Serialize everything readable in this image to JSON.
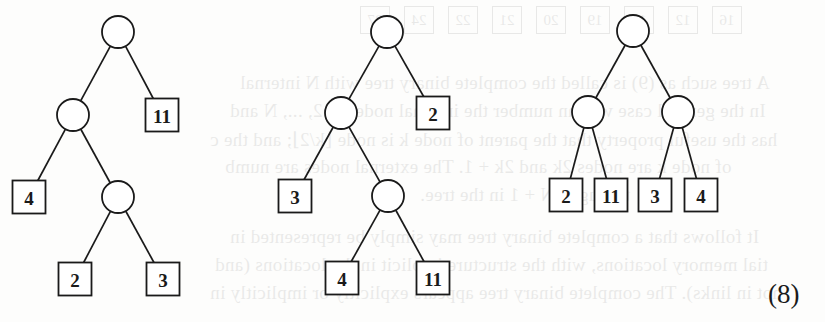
{
  "equation_label": "(8)",
  "figure": {
    "node_radius": 16,
    "leaf_size": 33,
    "trees": [
      {
        "id": "tree-1",
        "internal_nodes": [
          {
            "id": "root",
            "x": 118,
            "y": 32
          },
          {
            "id": "n1",
            "x": 73,
            "y": 115
          },
          {
            "id": "n2",
            "x": 118,
            "y": 197
          }
        ],
        "leaves": [
          {
            "id": "l11",
            "label": "11",
            "x": 162,
            "y": 115
          },
          {
            "id": "l4",
            "label": "4",
            "x": 29,
            "y": 197
          },
          {
            "id": "l2",
            "label": "2",
            "x": 75,
            "y": 279
          },
          {
            "id": "l3",
            "label": "3",
            "x": 163,
            "y": 279
          }
        ],
        "edges": [
          [
            "root",
            "n1"
          ],
          [
            "root",
            "l11"
          ],
          [
            "n1",
            "l4"
          ],
          [
            "n1",
            "n2"
          ],
          [
            "n2",
            "l2"
          ],
          [
            "n2",
            "l3"
          ]
        ]
      },
      {
        "id": "tree-2",
        "internal_nodes": [
          {
            "id": "root",
            "x": 387,
            "y": 32
          },
          {
            "id": "n1",
            "x": 341,
            "y": 113
          },
          {
            "id": "n2",
            "x": 388,
            "y": 196
          }
        ],
        "leaves": [
          {
            "id": "l2",
            "label": "2",
            "x": 433,
            "y": 113
          },
          {
            "id": "l3",
            "label": "3",
            "x": 295,
            "y": 196
          },
          {
            "id": "l4",
            "label": "4",
            "x": 342,
            "y": 278
          },
          {
            "id": "l11",
            "label": "11",
            "x": 433,
            "y": 278
          }
        ],
        "edges": [
          [
            "root",
            "n1"
          ],
          [
            "root",
            "l2"
          ],
          [
            "n1",
            "l3"
          ],
          [
            "n1",
            "n2"
          ],
          [
            "n2",
            "l4"
          ],
          [
            "n2",
            "l11"
          ]
        ]
      },
      {
        "id": "tree-3",
        "internal_nodes": [
          {
            "id": "root",
            "x": 633,
            "y": 31
          },
          {
            "id": "n1",
            "x": 588,
            "y": 112
          },
          {
            "id": "n2",
            "x": 678,
            "y": 112
          }
        ],
        "leaves": [
          {
            "id": "l2",
            "label": "2",
            "x": 566,
            "y": 195
          },
          {
            "id": "l11",
            "label": "11",
            "x": 611,
            "y": 195
          },
          {
            "id": "l3",
            "label": "3",
            "x": 655,
            "y": 195
          },
          {
            "id": "l4",
            "label": "4",
            "x": 701,
            "y": 195
          }
        ],
        "edges": [
          [
            "root",
            "n1"
          ],
          [
            "root",
            "n2"
          ],
          [
            "n1",
            "l2"
          ],
          [
            "n1",
            "l11"
          ],
          [
            "n2",
            "l3"
          ],
          [
            "n2",
            "l4"
          ]
        ]
      }
    ]
  },
  "show_through": {
    "boxes": [
      "16",
      "12",
      "18",
      "19",
      "20",
      "21",
      "22",
      "24",
      "27"
    ],
    "lines": [
      "A tree such as (9) is called the complete binary tree with N internal",
      "In the general case we can number the internal nodes 1, 2, ..., N and",
      "has the useful property that the parent of node k is node ⌊k/2⌋; and the c",
      "of node k are nodes 2k and 2k + 1. The external nodes are numb",
      "through 2N + 1 in the tree.",
      "It follows that a complete binary tree may simply be represented in",
      "tial memory locations, with the structure implicit in the locations (and",
      "not in links). The complete binary tree appears explicitly or implicitly in"
    ]
  }
}
